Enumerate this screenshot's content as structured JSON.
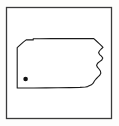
{
  "figure": {
    "kind": "state-outline-map-thumbnail",
    "background_color": "#fdfdfc",
    "interior_fill": "#ffffff"
  },
  "frame": {
    "name": "outer-border-frame",
    "x": 6.5,
    "y": 7.5,
    "width": 105,
    "height": 111,
    "stroke_color": "#3a3a3a",
    "stroke_width": 1.3,
    "fill": "#ffffff"
  },
  "state_outline": {
    "name": "pennsylvania-outline",
    "stroke_color": "#1a1a1a",
    "stroke_width": 1.1,
    "fill": "#ffffff",
    "path": "M 17.2,47.6 L 20.5,44.6 L 23.3,42.1 L 26.2,39.9 L 29.5,39.9 L 33.2,39.9 L 33.2,38.7 L 40,38.7 L 52,38.6 L 64,38.6 L 76,38.6 L 86,38.6 L 93.8,38.6 L 96.4,41.0 L 99.2,43.6 L 101.6,45.8 L 103.0,47.4 L 101.2,49.0 L 99.4,51.0 L 98.6,52.8 L 99.6,54.6 L 101.4,56.2 L 102.8,58.0 L 101.8,60.0 L 99.6,61.6 L 97.6,63.2 L 96.6,65.2 L 97.4,67.2 L 99.0,69.0 L 100.4,71.0 L 100.8,73.2 L 99.6,75.4 L 97.8,77.2 L 96.0,79.0 L 94.4,81.0 L 93.2,83.2 L 91.4,84.8 L 89.2,85.8 L 87.6,86.6 L 85.4,87.0 L 80,87.4 L 70,87.6 L 58,87.8 L 46,87.9 L 34,88.0 L 24,88.0 L 17.2,88.0 Z"
  },
  "markers": [
    {
      "name": "location-dot-marker",
      "cx": 25.6,
      "cy": 79.0,
      "r": 2.3,
      "color": "#111111"
    }
  ]
}
